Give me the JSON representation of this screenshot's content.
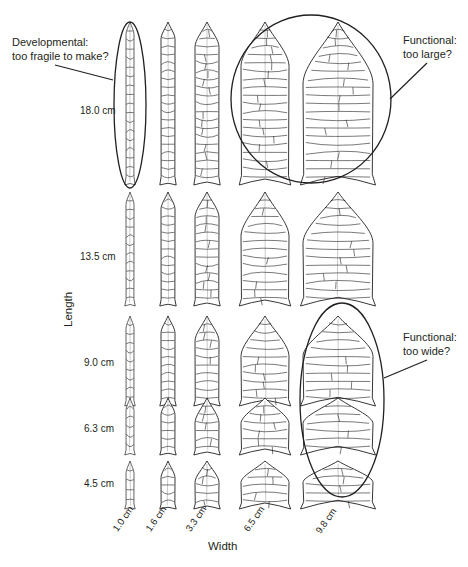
{
  "figure": {
    "x_axis_label": "Width",
    "y_axis_label": "Length",
    "widths": [
      {
        "label": "1.0 cm",
        "value_cm": 1.0
      },
      {
        "label": "1.6 cm",
        "value_cm": 1.6
      },
      {
        "label": "3.3 cm",
        "value_cm": 3.3
      },
      {
        "label": "6.5 cm",
        "value_cm": 6.5
      },
      {
        "label": "9.8 cm",
        "value_cm": 9.8
      }
    ],
    "lengths": [
      {
        "label": "18.0 cm",
        "value_cm": 18.0
      },
      {
        "label": "13.5 cm",
        "value_cm": 13.5
      },
      {
        "label": "9.0 cm",
        "value_cm": 9.0
      },
      {
        "label": "6.3 cm",
        "value_cm": 6.3
      },
      {
        "label": "4.5 cm",
        "value_cm": 4.5
      }
    ],
    "annotations": [
      {
        "id": "developmental",
        "text": "Developmental:\ntoo fragile to make?",
        "circled": [
          "18.0 cm x 1.0 cm"
        ]
      },
      {
        "id": "too-large",
        "text": "Functional:\ntoo large?",
        "circled": [
          "18.0 cm x 6.5 cm",
          "18.0 cm x 9.8 cm"
        ]
      },
      {
        "id": "too-wide",
        "text": "Functional:\ntoo wide?",
        "circled": [
          "9.0 cm x 9.8 cm",
          "6.3 cm x 9.8 cm"
        ]
      }
    ],
    "colors": {
      "line": "#231f20",
      "background": "#ffffff"
    }
  }
}
